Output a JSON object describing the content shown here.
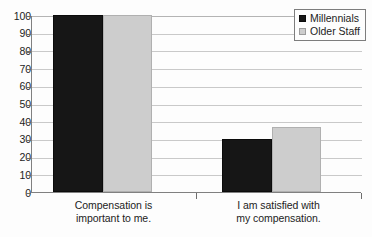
{
  "chart_data": {
    "type": "bar",
    "title": "",
    "subtitle": "",
    "xlabel": "",
    "ylabel": "",
    "ylim": [
      0,
      100
    ],
    "ytick_step": 10,
    "yticks": [
      100,
      90,
      80,
      70,
      60,
      50,
      40,
      30,
      20,
      10,
      0
    ],
    "grid": true,
    "legend_position": "top-right",
    "categories": [
      "Compensation is important to me.",
      "I am satisfied with my compensation."
    ],
    "category_lines": [
      [
        "Compensation is",
        "important to me."
      ],
      [
        "I am satisfied with",
        "my compensation."
      ]
    ],
    "series": [
      {
        "name": "Millennials",
        "color": "#161616",
        "values": [
          100,
          30
        ]
      },
      {
        "name": "Older Staff",
        "color": "#cdcdcd",
        "values": [
          100,
          37
        ]
      }
    ]
  },
  "legend": {
    "items": [
      {
        "label": "Millennials"
      },
      {
        "label": "Older Staff"
      }
    ]
  },
  "colors": {
    "series_millennials": "#161616",
    "series_older_staff": "#cdcdcd",
    "gridline": "#c9c9c9",
    "axis": "#808080",
    "text": "#1c1c1c",
    "background": "#fdfdfd"
  }
}
